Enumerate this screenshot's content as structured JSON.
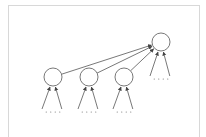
{
  "diagram": {
    "type": "tree-aggregation",
    "stroke_color": "#555555",
    "node_fill": "#ffffff",
    "frame_color": "#d8d8d8",
    "nodes": [
      {
        "id": "child-1",
        "cx": 53,
        "cy": 77,
        "r": 9
      },
      {
        "id": "child-2",
        "cx": 89,
        "cy": 77,
        "r": 9
      },
      {
        "id": "child-3",
        "cx": 124,
        "cy": 77,
        "r": 9
      },
      {
        "id": "parent",
        "cx": 161,
        "cy": 42,
        "r": 9
      }
    ],
    "edges": [
      {
        "from": "child-1",
        "to": "parent"
      },
      {
        "from": "child-2",
        "to": "parent"
      },
      {
        "from": "child-3",
        "to": "parent"
      }
    ],
    "input_groups": [
      {
        "target": "child-1",
        "dots_y": 112
      },
      {
        "target": "child-2",
        "dots_y": 112
      },
      {
        "target": "child-3",
        "dots_y": 112
      },
      {
        "target": "parent",
        "dots_y": 79
      }
    ]
  }
}
